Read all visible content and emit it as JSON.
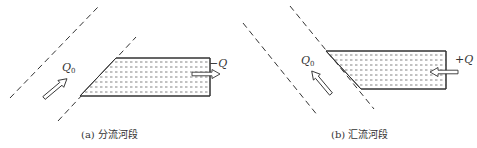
{
  "panels": [
    {
      "id": "a",
      "caption": "(a) 分流河段",
      "inflow_label": "Q",
      "inflow_subscript": "0",
      "branch_label": "−Q",
      "branch_direction": "outflow"
    },
    {
      "id": "b",
      "caption": "(b) 汇流河段",
      "inflow_label": "Q",
      "inflow_subscript": "0",
      "branch_label": "+Q",
      "branch_direction": "inflow"
    }
  ],
  "colors": {
    "line": "#333333",
    "hatch": "#666666",
    "background": "#ffffff"
  }
}
